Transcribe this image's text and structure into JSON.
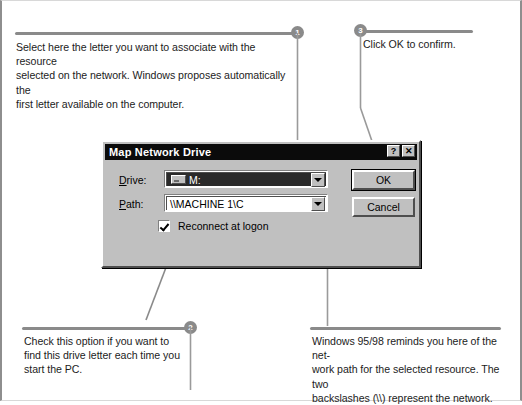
{
  "figure": {
    "type": "annotated-screenshot"
  },
  "annotations": [
    {
      "number": "1",
      "text": "Select here the letter you want to associate with the resource\nselected on the network. Windows proposes automatically the\nfirst letter available on the computer.",
      "badge_position": "top-right-of-rule",
      "target": "drive-combo"
    },
    {
      "number": "2",
      "text": "Check this option if you want to\nfind this drive letter each time you\nstart the PC.",
      "badge_position": "top-right-of-rule",
      "target": "reconnect-checkbox"
    },
    {
      "number": "3",
      "text": "Click OK to confirm.",
      "badge_position": "top-left-of-rule",
      "target": "ok-button"
    },
    {
      "number": "",
      "text": "Windows 95/98 reminds you here of the net-\nwork path for the selected resource. The two\nbackslashes (\\\\) represent the network.",
      "badge_position": "none",
      "target": "path-combo"
    }
  ],
  "dialog": {
    "title": "Map Network Drive",
    "titlebar_buttons": [
      {
        "name": "help",
        "glyph": "?"
      },
      {
        "name": "close",
        "glyph": "✕"
      }
    ],
    "fields": {
      "drive": {
        "label": "Drive:",
        "label_html": "<u>D</u>rive:",
        "value": "M:",
        "icon": "drive-icon",
        "selected": true,
        "dropdown_glyph": "▼"
      },
      "path": {
        "label": "Path:",
        "label_html": "<u>P</u>ath:",
        "value": "\\\\MACHINE 1\\C",
        "placeholder": "",
        "selected": false,
        "dropdown_glyph": "▼"
      }
    },
    "checkbox": {
      "label": "Reconnect at logon",
      "checked": true
    },
    "buttons": {
      "ok": "OK",
      "cancel": "Cancel"
    }
  },
  "colors": {
    "dialog_face": "#c0c0c0",
    "titlebar": "#0b0b0b",
    "titlebar_text": "#ffffff",
    "callout_rule": "#8a8a8a",
    "badge_fill": "#8a8a8a",
    "selection": "#2a2a2a",
    "page_border": "#8e8e8e"
  }
}
